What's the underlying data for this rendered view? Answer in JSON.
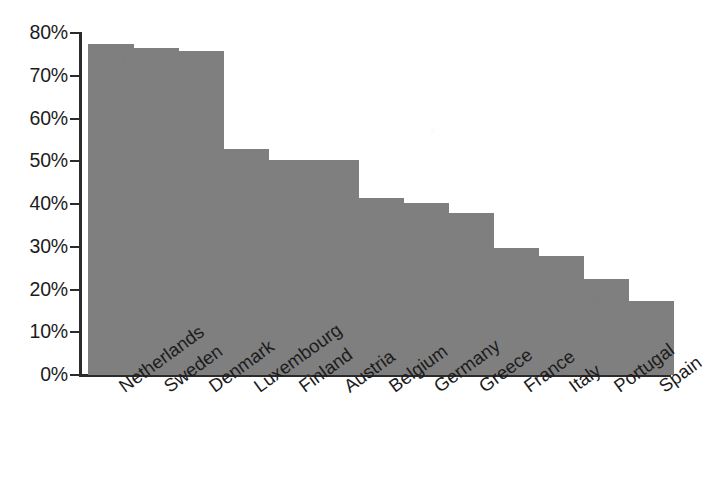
{
  "chart_data": {
    "type": "bar",
    "title": "",
    "subtitle": "",
    "xlabel": "",
    "ylabel": "",
    "categories": [
      "Netherlands",
      "Sweden",
      "Denmark",
      "Luxembourg",
      "Finland",
      "Austria",
      "Belgium",
      "Germany",
      "Greece",
      "France",
      "Italy",
      "Portugal",
      "Spain"
    ],
    "values": [
      77.5,
      76.6,
      75.7,
      52.9,
      50.3,
      50.3,
      41.4,
      40.2,
      37.9,
      29.8,
      27.8,
      22.5,
      17.2
    ],
    "value_unit": "%",
    "ylim": [
      0,
      80
    ],
    "ytick_values": [
      0,
      10,
      20,
      30,
      40,
      50,
      60,
      70,
      80
    ],
    "ytick_labels": [
      "0%",
      "10%",
      "20%",
      "30%",
      "40%",
      "50%",
      "60%",
      "70%",
      "80%"
    ],
    "grid": false,
    "legend": null,
    "legend_position": "none",
    "bar_color": "#7f7f7f",
    "axis_color": "#2b2b2b",
    "background_color": "#ffffff",
    "xtick_label_rotation_deg": -36,
    "series": [
      {
        "name": "",
        "values": [
          77.5,
          76.6,
          75.7,
          52.9,
          50.3,
          50.3,
          41.4,
          40.2,
          37.9,
          29.8,
          27.8,
          22.5,
          17.2
        ]
      }
    ]
  }
}
